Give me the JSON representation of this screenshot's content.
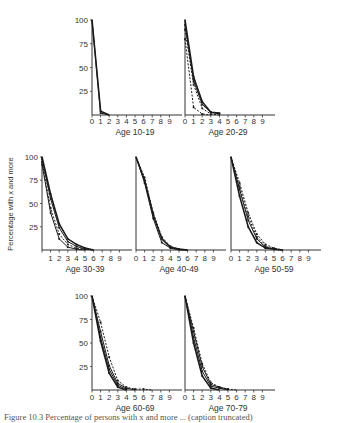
{
  "figure": {
    "y_axis_label": "Percentage with x and more",
    "caption": "Figure 10.3  Percentage of persons with x and more ... (caption truncated)",
    "y_ticks": [
      "100",
      "75",
      "50",
      "25"
    ],
    "x_ticks": [
      "0",
      "1",
      "2",
      "3",
      "4",
      "5",
      "6",
      "7",
      "8",
      "9"
    ]
  },
  "chart_data": [
    {
      "type": "line",
      "title": "Age 10-19",
      "xlabel": "Age 10-19",
      "ylabel": "Percentage with x and more",
      "xlim": [
        0,
        10
      ],
      "ylim": [
        0,
        100
      ],
      "grid": false,
      "series": [
        {
          "name": "curve 1",
          "style": "solid",
          "x": [
            0,
            1,
            2
          ],
          "y": [
            100,
            4,
            0
          ]
        },
        {
          "name": "curve 2",
          "style": "solid",
          "x": [
            0,
            1,
            2
          ],
          "y": [
            100,
            2,
            0
          ]
        }
      ]
    },
    {
      "type": "line",
      "title": "Age 20-29",
      "xlabel": "Age 20-29",
      "ylabel": "Percentage with x and more",
      "xlim": [
        0,
        10
      ],
      "ylim": [
        0,
        100
      ],
      "grid": false,
      "series": [
        {
          "name": "curve 1",
          "style": "solid",
          "x": [
            0,
            1,
            2,
            3,
            4
          ],
          "y": [
            100,
            40,
            14,
            3,
            2
          ]
        },
        {
          "name": "curve 2",
          "style": "solid",
          "x": [
            0,
            1,
            2,
            3,
            4
          ],
          "y": [
            95,
            36,
            11,
            3,
            1
          ]
        },
        {
          "name": "curve 3",
          "style": "dashed",
          "x": [
            0,
            1,
            2,
            3,
            4
          ],
          "y": [
            90,
            32,
            7,
            1,
            0
          ]
        },
        {
          "name": "curve 4",
          "style": "dashed",
          "x": [
            0,
            1,
            2,
            3
          ],
          "y": [
            80,
            8,
            1,
            0
          ]
        }
      ]
    },
    {
      "type": "line",
      "title": "Age 30-39",
      "xlabel": "Age 30-39",
      "ylabel": "Percentage with x and more",
      "xlim": [
        0,
        10
      ],
      "ylim": [
        0,
        100
      ],
      "grid": false,
      "series": [
        {
          "name": "curve 1",
          "style": "solid",
          "x": [
            0,
            1,
            2,
            3,
            4,
            5,
            6
          ],
          "y": [
            100,
            60,
            28,
            12,
            6,
            2,
            0
          ]
        },
        {
          "name": "curve 2",
          "style": "solid",
          "x": [
            0,
            1,
            2,
            3,
            4,
            5,
            6
          ],
          "y": [
            98,
            55,
            24,
            9,
            4,
            1,
            0
          ]
        },
        {
          "name": "curve 3",
          "style": "dashed",
          "x": [
            0,
            1,
            2,
            3,
            4,
            5,
            6
          ],
          "y": [
            95,
            45,
            17,
            6,
            2,
            1,
            0
          ]
        },
        {
          "name": "curve 4",
          "style": "solid",
          "x": [
            0,
            1,
            2,
            3,
            4,
            5
          ],
          "y": [
            92,
            40,
            12,
            3,
            1,
            0
          ]
        }
      ]
    },
    {
      "type": "line",
      "title": "Age 40-49",
      "xlabel": "Age 40-49",
      "ylabel": "Percentage with x and more",
      "xlim": [
        0,
        10
      ],
      "ylim": [
        0,
        100
      ],
      "grid": false,
      "series": [
        {
          "name": "curve 1",
          "style": "solid",
          "x": [
            0,
            1,
            2,
            3,
            4,
            5,
            6
          ],
          "y": [
            100,
            75,
            38,
            12,
            3,
            1,
            0
          ]
        },
        {
          "name": "curve 2",
          "style": "solid",
          "x": [
            0,
            1,
            2,
            3,
            4,
            5,
            6
          ],
          "y": [
            100,
            72,
            34,
            8,
            2,
            0,
            0
          ]
        },
        {
          "name": "curve 3",
          "style": "dashed",
          "x": [
            0,
            1,
            2,
            3,
            4,
            5,
            6
          ],
          "y": [
            100,
            78,
            40,
            14,
            4,
            1,
            0
          ]
        }
      ]
    },
    {
      "type": "line",
      "title": "Age 50-59",
      "xlabel": "Age 50-59",
      "ylabel": "Percentage with x and more",
      "xlim": [
        0,
        10
      ],
      "ylim": [
        0,
        100
      ],
      "grid": false,
      "series": [
        {
          "name": "curve 1",
          "style": "solid",
          "x": [
            0,
            1,
            2,
            3,
            4,
            5,
            6
          ],
          "y": [
            100,
            58,
            25,
            8,
            2,
            1,
            0
          ]
        },
        {
          "name": "curve 2",
          "style": "solid",
          "x": [
            0,
            1,
            2,
            3,
            4,
            5,
            6
          ],
          "y": [
            100,
            65,
            32,
            12,
            3,
            1,
            0
          ]
        },
        {
          "name": "curve 3",
          "style": "dashed",
          "x": [
            0,
            1,
            2,
            3,
            4,
            5,
            6
          ],
          "y": [
            100,
            72,
            40,
            17,
            6,
            2,
            0
          ]
        },
        {
          "name": "curve 4",
          "style": "dashed",
          "x": [
            0,
            1,
            2,
            3,
            4,
            5,
            6
          ],
          "y": [
            100,
            68,
            36,
            14,
            4,
            1,
            0
          ]
        }
      ]
    },
    {
      "type": "line",
      "title": "Age 60-69",
      "xlabel": "Age 60-69",
      "ylabel": "Percentage with x and more",
      "xlim": [
        0,
        10
      ],
      "ylim": [
        0,
        100
      ],
      "grid": false,
      "series": [
        {
          "name": "curve 1",
          "style": "solid",
          "x": [
            0,
            1,
            2,
            3,
            4
          ],
          "y": [
            100,
            52,
            18,
            3,
            0
          ]
        },
        {
          "name": "curve 2",
          "style": "solid",
          "x": [
            0,
            1,
            2,
            3,
            4
          ],
          "y": [
            100,
            56,
            22,
            5,
            1
          ]
        },
        {
          "name": "curve 3",
          "style": "solid",
          "x": [
            0,
            1,
            2,
            3,
            4,
            5
          ],
          "y": [
            100,
            62,
            26,
            7,
            2,
            0
          ]
        },
        {
          "name": "curve 4",
          "style": "dashed",
          "x": [
            0,
            1,
            2,
            3,
            4,
            5,
            6,
            7
          ],
          "y": [
            100,
            72,
            35,
            10,
            3,
            1,
            1,
            0
          ]
        }
      ]
    },
    {
      "type": "line",
      "title": "Age 70-79",
      "xlabel": "Age 70-79",
      "ylabel": "Percentage with x and more",
      "xlim": [
        0,
        10
      ],
      "ylim": [
        0,
        100
      ],
      "grid": false,
      "series": [
        {
          "name": "curve 1",
          "style": "solid",
          "x": [
            0,
            1,
            2,
            3,
            4
          ],
          "y": [
            100,
            50,
            15,
            2,
            0
          ]
        },
        {
          "name": "curve 2",
          "style": "solid",
          "x": [
            0,
            1,
            2,
            3,
            4,
            5
          ],
          "y": [
            100,
            56,
            20,
            4,
            2,
            0
          ]
        },
        {
          "name": "curve 3",
          "style": "solid",
          "x": [
            0,
            1,
            2,
            3,
            4,
            5
          ],
          "y": [
            100,
            62,
            25,
            6,
            3,
            1
          ]
        },
        {
          "name": "curve 4",
          "style": "dashed",
          "x": [
            0,
            1,
            2,
            3,
            4,
            5,
            6
          ],
          "y": [
            100,
            66,
            28,
            8,
            3,
            1,
            0
          ]
        }
      ]
    }
  ],
  "layout": {
    "panels": [
      {
        "ox": 92,
        "top": 20,
        "base": 115,
        "w": 86,
        "show_y": true,
        "labels_y": 121,
        "age_y": 132
      },
      {
        "ox": 185,
        "top": 20,
        "base": 115,
        "w": 86,
        "show_y": false,
        "labels_y": 121,
        "age_y": 132
      },
      {
        "ox": 42,
        "top": 157,
        "base": 250,
        "w": 86,
        "show_y": true,
        "labels_y": 258,
        "age_y": 269,
        "skip_zero": true
      },
      {
        "ox": 136,
        "top": 157,
        "base": 250,
        "w": 86,
        "show_y": false,
        "labels_y": 258,
        "age_y": 269
      },
      {
        "ox": 231,
        "top": 157,
        "base": 250,
        "w": 86,
        "show_y": false,
        "labels_y": 258,
        "age_y": 269
      },
      {
        "ox": 92,
        "top": 296,
        "base": 390,
        "w": 86,
        "show_y": true,
        "labels_y": 397,
        "age_y": 408
      },
      {
        "ox": 185,
        "top": 296,
        "base": 390,
        "w": 86,
        "show_y": false,
        "labels_y": 397,
        "age_y": 408
      }
    ],
    "ylabel_pos": {
      "x": 13,
      "y": 204
    }
  }
}
